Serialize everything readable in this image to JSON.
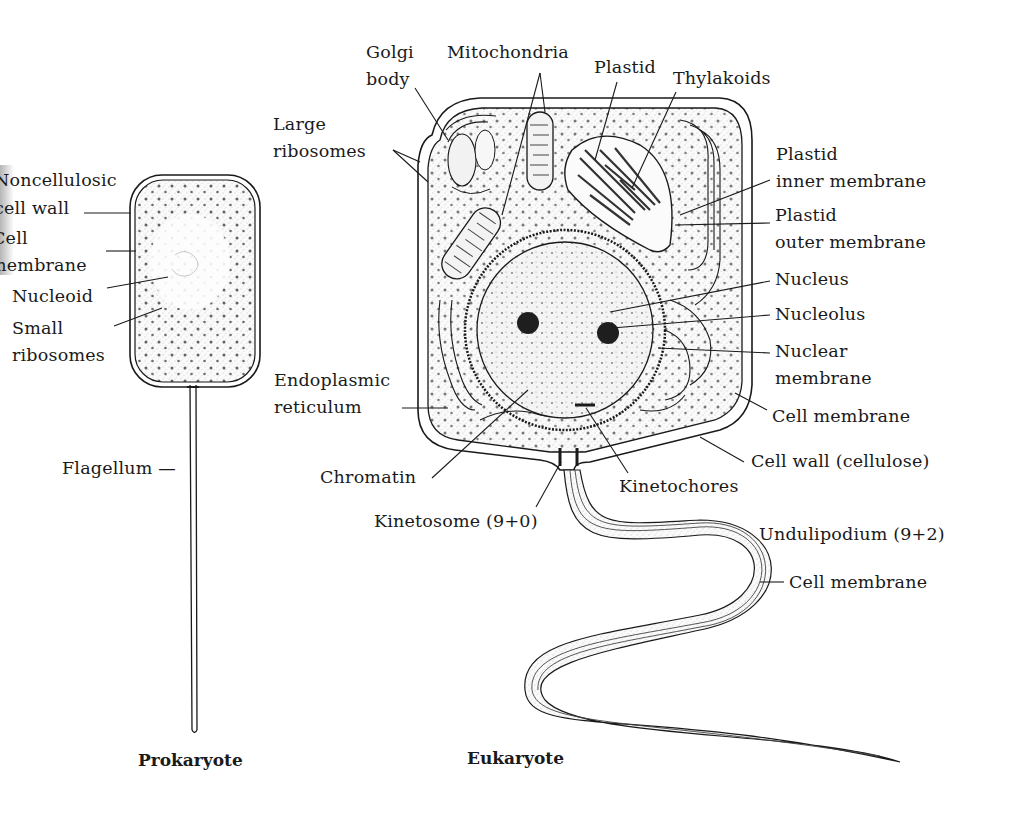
{
  "figure": {
    "type": "biology-diagram",
    "ink_color": "#1a1a1a",
    "background": "#ffffff"
  },
  "prokaryote": {
    "caption": "Prokaryote",
    "labels": {
      "noncellulosic_1": "Noncellulosic",
      "noncellulosic_2": "cell wall",
      "cell_membrane_1": "Cell",
      "cell_membrane_2": "membrane",
      "nucleoid": "Nucleoid",
      "small_ribosomes_1": "Small",
      "small_ribosomes_2": "ribosomes",
      "flagellum": "Flagellum —"
    }
  },
  "eukaryote": {
    "caption": "Eukaryote",
    "labels": {
      "golgi_1": "Golgi",
      "golgi_2": "body",
      "mitochondria": "Mitochondria",
      "plastid": "Plastid",
      "thylakoids": "Thylakoids",
      "large_ribosomes_1": "Large",
      "large_ribosomes_2": "ribosomes",
      "plastid_inner_1": "Plastid",
      "plastid_inner_2": "inner membrane",
      "plastid_outer_1": "Plastid",
      "plastid_outer_2": "outer membrane",
      "nucleus": "Nucleus",
      "nucleolus": "Nucleolus",
      "nuclear_membrane_1": "Nuclear",
      "nuclear_membrane_2": "membrane",
      "endoplasmic_1": "Endoplasmic",
      "endoplasmic_2": "reticulum",
      "cell_membrane": "Cell  membrane",
      "cell_wall": "Cell  wall  (cellulose)",
      "chromatin": "Chromatin",
      "kinetochores": "Kinetochores",
      "kinetosome": "Kinetosome  (9+0)",
      "undulipodium": "Undulipodium  (9+2)",
      "undulipodium_membrane": "Cell  membrane"
    }
  }
}
